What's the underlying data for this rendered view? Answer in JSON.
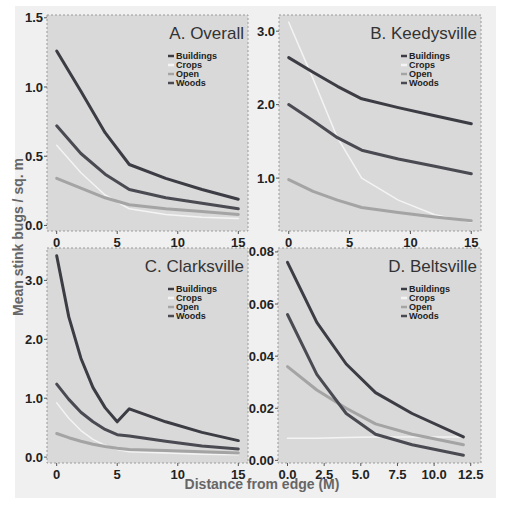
{
  "figure": {
    "ylabel": "Mean stink bugs / sq. m",
    "xlabel": "Distance from edge (M)"
  },
  "series_styles": {
    "Buildings": {
      "color": "#3c3c44",
      "width": 3
    },
    "Crops": {
      "color": "#f4f4f4",
      "width": 1.5
    },
    "Open": {
      "color": "#a4a4a4",
      "width": 3
    },
    "Woods": {
      "color": "#4a4a52",
      "width": 3
    }
  },
  "legend": [
    "Buildings",
    "Crops",
    "Open",
    "Woods"
  ],
  "chart_data": [
    {
      "type": "line",
      "title": "A. Overall",
      "xlabel": "Distance from edge (M)",
      "ylabel": "Mean stink bugs / sq. m",
      "xlim": [
        -0.8,
        15.8
      ],
      "ylim": [
        -0.04,
        1.52
      ],
      "xticks": [
        0,
        5,
        10,
        15
      ],
      "xtick_labels": [
        "0",
        "5",
        "10",
        "15"
      ],
      "yticks": [
        0.0,
        0.5,
        1.0,
        1.5
      ],
      "ytick_labels": [
        "0.0",
        "0.5",
        "1.0",
        "1.5"
      ],
      "x": [
        0,
        2,
        4,
        6,
        9,
        12,
        15
      ],
      "series": [
        {
          "name": "Buildings",
          "values": [
            1.26,
            0.97,
            0.67,
            0.44,
            0.34,
            0.26,
            0.19
          ]
        },
        {
          "name": "Crops",
          "values": [
            0.58,
            0.38,
            0.22,
            0.12,
            0.08,
            0.06,
            0.05
          ]
        },
        {
          "name": "Open",
          "values": [
            0.34,
            0.27,
            0.2,
            0.15,
            0.12,
            0.1,
            0.08
          ]
        },
        {
          "name": "Woods",
          "values": [
            0.72,
            0.52,
            0.37,
            0.26,
            0.2,
            0.16,
            0.12
          ]
        }
      ],
      "legend_position": "upper right",
      "grid": false
    },
    {
      "type": "line",
      "title": "B. Keedysville",
      "xlabel": "Distance from edge (M)",
      "ylabel": "Mean stink bugs / sq. m",
      "xlim": [
        -0.8,
        15.8
      ],
      "ylim": [
        0.28,
        3.22
      ],
      "xticks": [
        0,
        5,
        10,
        15
      ],
      "xtick_labels": [
        "0",
        "5",
        "10",
        "15"
      ],
      "yticks": [
        1.0,
        2.0,
        3.0
      ],
      "ytick_labels": [
        "1.0",
        "2.0",
        "3.0"
      ],
      "x": [
        0,
        2,
        4,
        6,
        9,
        12,
        15
      ],
      "series": [
        {
          "name": "Buildings",
          "values": [
            2.64,
            2.44,
            2.25,
            2.08,
            1.96,
            1.85,
            1.74
          ]
        },
        {
          "name": "Crops",
          "values": [
            3.12,
            2.35,
            1.55,
            1.0,
            0.7,
            0.5,
            0.4
          ]
        },
        {
          "name": "Open",
          "values": [
            0.98,
            0.82,
            0.7,
            0.6,
            0.53,
            0.47,
            0.42
          ]
        },
        {
          "name": "Woods",
          "values": [
            2.0,
            1.78,
            1.55,
            1.38,
            1.26,
            1.16,
            1.06
          ]
        }
      ],
      "legend_position": "upper right",
      "grid": false
    },
    {
      "type": "line",
      "title": "C. Clarksville",
      "xlabel": "Distance from edge (M)",
      "ylabel": "Mean stink bugs / sq. m",
      "xlim": [
        -0.8,
        15.8
      ],
      "ylim": [
        -0.1,
        3.55
      ],
      "xticks": [
        0,
        5,
        10,
        15
      ],
      "xtick_labels": [
        "0",
        "5",
        "10",
        "15"
      ],
      "yticks": [
        0.0,
        1.0,
        2.0,
        3.0
      ],
      "ytick_labels": [
        "0.0",
        "1.0",
        "2.0",
        "3.0"
      ],
      "x": [
        0,
        1,
        2,
        3,
        4,
        5,
        6,
        9,
        12,
        15
      ],
      "series": [
        {
          "name": "Buildings",
          "values": [
            3.42,
            2.38,
            1.68,
            1.18,
            0.84,
            0.6,
            0.82,
            0.6,
            0.42,
            0.28
          ]
        },
        {
          "name": "Crops",
          "values": [
            0.92,
            0.66,
            0.45,
            0.3,
            0.2,
            0.13,
            0.09,
            0.07,
            0.05,
            0.04
          ]
        },
        {
          "name": "Open",
          "values": [
            0.4,
            0.33,
            0.27,
            0.22,
            0.18,
            0.15,
            0.13,
            0.11,
            0.09,
            0.07
          ]
        },
        {
          "name": "Woods",
          "values": [
            1.24,
            0.98,
            0.76,
            0.6,
            0.47,
            0.38,
            0.36,
            0.27,
            0.19,
            0.14
          ]
        }
      ],
      "legend_position": "upper right",
      "grid": false
    },
    {
      "type": "line",
      "title": "D. Beltsville",
      "xlabel": "Distance from edge (M)",
      "ylabel": "Mean stink bugs / sq. m",
      "xlim": [
        -0.65,
        13.2
      ],
      "ylim": [
        -0.001,
        0.0815
      ],
      "xticks": [
        0.0,
        2.5,
        5.0,
        7.5,
        10.0,
        12.5
      ],
      "xtick_labels": [
        "0.0",
        "2.5",
        "5.0",
        "7.5",
        "10.0",
        "12.5"
      ],
      "yticks": [
        0.0,
        0.02,
        0.04,
        0.06,
        0.08
      ],
      "ytick_labels": [
        "0.00",
        "0.02",
        "0.04",
        "0.06",
        "0.08"
      ],
      "x": [
        0,
        2,
        4,
        6,
        8.5,
        12
      ],
      "series": [
        {
          "name": "Buildings",
          "values": [
            0.076,
            0.053,
            0.037,
            0.026,
            0.018,
            0.009
          ]
        },
        {
          "name": "Crops",
          "values": [
            0.0085,
            0.0085,
            0.0088,
            0.009,
            0.009,
            0.009
          ]
        },
        {
          "name": "Open",
          "values": [
            0.036,
            0.027,
            0.02,
            0.014,
            0.01,
            0.006
          ]
        },
        {
          "name": "Woods",
          "values": [
            0.056,
            0.033,
            0.018,
            0.01,
            0.006,
            0.002
          ]
        }
      ],
      "legend_position": "upper right",
      "grid": false
    }
  ]
}
